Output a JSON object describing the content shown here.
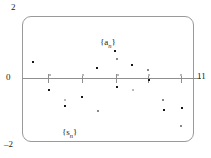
{
  "figure": {
    "title": "",
    "background_color": "#ffffff",
    "frame_color": "#9a9a9a",
    "axis_color": "#8f8f8f",
    "point_color": "#2b2b2b"
  },
  "axes": {
    "y_max_label": "2",
    "y_zero_label": "0",
    "y_min_label": "–2",
    "x_max_label": "11"
  },
  "series_labels": {
    "upper": {
      "base": "{a",
      "sub": "n",
      "close": "}"
    },
    "lower": {
      "base": "{s",
      "sub": "n",
      "close": "}"
    }
  },
  "chart_data": {
    "type": "scatter",
    "title": "",
    "xlabel": "",
    "ylabel": "",
    "xlim": [
      0,
      11
    ],
    "ylim": [
      -2,
      2
    ],
    "grid": false,
    "legend": "inline-annotations",
    "annotations": [
      {
        "text": "{a_n}",
        "x": 6.0,
        "y": 1.1
      },
      {
        "text": "{s_n}",
        "x": 3.2,
        "y": -1.7
      }
    ],
    "xticks": [
      2,
      4,
      6,
      8,
      10
    ],
    "xticklabels": [
      "",
      "",
      "",
      "",
      ""
    ],
    "yticks": [
      -2,
      0,
      2
    ],
    "yticklabels": [
      "–2",
      "0",
      "2"
    ],
    "series": [
      {
        "name": "{a_n}",
        "x": [
          1,
          2,
          3,
          4,
          5,
          6,
          7,
          8,
          9,
          10,
          11
        ],
        "values": [
          0.52,
          -0.3,
          -0.52,
          -0.42,
          0.22,
          0.85,
          0.63,
          0.4,
          -0.42,
          -0.55,
          -0.36
        ]
      },
      {
        "name": "{s_n}",
        "x": [
          1,
          2,
          3,
          4,
          5,
          6,
          7,
          8,
          9,
          10,
          11
        ],
        "values": [
          0.52,
          0.22,
          -0.3,
          -0.72,
          -0.5,
          0.35,
          -0.18,
          0.22,
          -0.2,
          -0.75,
          -1.11
        ]
      }
    ]
  },
  "points": [
    {
      "cx": 32,
      "cy": 61,
      "weight": "bold"
    },
    {
      "cx": 48,
      "cy": 89,
      "weight": "bold"
    },
    {
      "cx": 49,
      "cy": 74,
      "weight": "faint"
    },
    {
      "cx": 64,
      "cy": 99,
      "weight": "faint"
    },
    {
      "cx": 64,
      "cy": 105,
      "weight": "bold"
    },
    {
      "cx": 81,
      "cy": 96,
      "weight": "bold"
    },
    {
      "cx": 82,
      "cy": 74,
      "weight": "faint"
    },
    {
      "cx": 97,
      "cy": 110,
      "weight": "mid"
    },
    {
      "cx": 96,
      "cy": 67,
      "weight": "bold"
    },
    {
      "cx": 114,
      "cy": 50,
      "weight": "bold"
    },
    {
      "cx": 116,
      "cy": 58,
      "weight": "mid"
    },
    {
      "cx": 116,
      "cy": 86,
      "weight": "bold"
    },
    {
      "cx": 117,
      "cy": 74,
      "weight": "faint"
    },
    {
      "cx": 131,
      "cy": 64,
      "weight": "bold"
    },
    {
      "cx": 132,
      "cy": 89,
      "weight": "faint"
    },
    {
      "cx": 147,
      "cy": 69,
      "weight": "mid"
    },
    {
      "cx": 148,
      "cy": 79,
      "weight": "bold"
    },
    {
      "cx": 148,
      "cy": 74,
      "weight": "faint"
    },
    {
      "cx": 162,
      "cy": 99,
      "weight": "mid"
    },
    {
      "cx": 163,
      "cy": 109,
      "weight": "bold"
    },
    {
      "cx": 180,
      "cy": 74,
      "weight": "faint"
    },
    {
      "cx": 181,
      "cy": 107,
      "weight": "bold"
    },
    {
      "cx": 180,
      "cy": 125,
      "weight": "mid"
    }
  ],
  "ticks": [
    {
      "x": 48
    },
    {
      "x": 82
    },
    {
      "x": 116
    },
    {
      "x": 148
    },
    {
      "x": 181
    }
  ]
}
